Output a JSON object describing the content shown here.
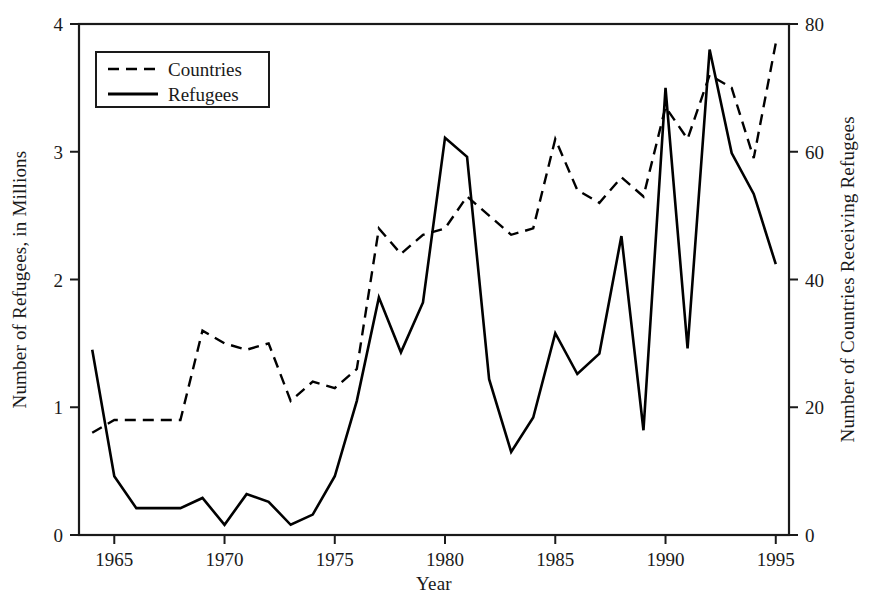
{
  "chart_data": {
    "type": "line",
    "title": "",
    "xlabel": "Year",
    "ylabel": "Number of Refugees, in Millions",
    "ylabel_right": "Number of Countries Receiving Refugees",
    "xlim": [
      1963.4,
      1995.6
    ],
    "ylim": [
      0,
      4
    ],
    "ylim_right": [
      0,
      80
    ],
    "xticks": [
      1965,
      1970,
      1975,
      1980,
      1985,
      1990,
      1995
    ],
    "xticklabels": [
      "1965",
      "1970",
      "1975",
      "1980",
      "1985",
      "1990",
      "1995"
    ],
    "yticks": [
      0,
      1,
      2,
      3,
      4
    ],
    "yticklabels": [
      "0",
      "1",
      "2",
      "3",
      "4"
    ],
    "yticks_right": [
      0,
      20,
      40,
      60,
      80
    ],
    "yticklabels_right": [
      "0",
      "20",
      "40",
      "60",
      "80"
    ],
    "grid": false,
    "legend_position": "upper left",
    "line_color": "#000000",
    "x": [
      1964,
      1965,
      1966,
      1967,
      1968,
      1969,
      1970,
      1971,
      1972,
      1973,
      1974,
      1975,
      1976,
      1977,
      1978,
      1979,
      1980,
      1981,
      1982,
      1983,
      1984,
      1985,
      1986,
      1987,
      1988,
      1989,
      1990,
      1991,
      1992,
      1993,
      1994,
      1995
    ],
    "series": [
      {
        "name": "Countries",
        "axis": "right",
        "style": "dashed",
        "units": "count of countries",
        "values": [
          16,
          18,
          18,
          18,
          18,
          32,
          30,
          29,
          30,
          21,
          24,
          23,
          26,
          48,
          44,
          47,
          48,
          53,
          50,
          47,
          48,
          62,
          54,
          52,
          56,
          53,
          67,
          62,
          72,
          70,
          59,
          77
        ]
      },
      {
        "name": "Refugees",
        "axis": "left",
        "style": "solid",
        "units": "millions",
        "values": [
          1.45,
          0.46,
          0.21,
          0.21,
          0.21,
          0.29,
          0.08,
          0.32,
          0.26,
          0.08,
          0.16,
          0.46,
          1.05,
          1.86,
          1.43,
          1.82,
          3.11,
          2.96,
          1.22,
          0.65,
          0.92,
          1.58,
          1.26,
          1.42,
          2.34,
          0.82,
          3.5,
          1.46,
          3.8,
          2.99,
          2.67,
          2.12
        ]
      }
    ],
    "legend": [
      {
        "label": "Countries",
        "style": "dashed"
      },
      {
        "label": "Refugees",
        "style": "solid"
      }
    ]
  },
  "plot_box": {
    "left": 79,
    "right": 789,
    "top": 24,
    "bottom": 535
  },
  "legend_box": {
    "left": 96,
    "top": 52,
    "width": 173,
    "height": 55
  }
}
